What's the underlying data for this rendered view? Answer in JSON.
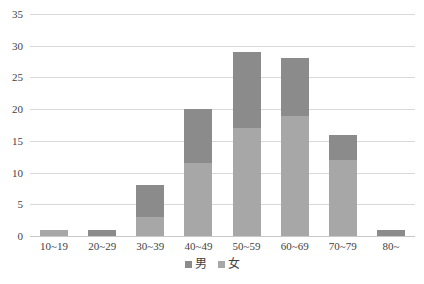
{
  "chart_data": {
    "type": "bar",
    "subtype": "stacked-column",
    "title": "",
    "subtitle": "",
    "xlabel": "",
    "ylabel": "",
    "categories": [
      "10~19",
      "20~29",
      "30~39",
      "40~49",
      "50~59",
      "60~69",
      "70~79",
      "80~"
    ],
    "series": [
      {
        "name": "女",
        "legend": "女",
        "color": "#a7a7a7",
        "stack_order": "bottom",
        "values": [
          1,
          0,
          3,
          11.5,
          17,
          19,
          12,
          0
        ]
      },
      {
        "name": "男",
        "legend": "男",
        "color": "#8b8b8b",
        "stack_order": "top",
        "values": [
          0,
          1,
          5,
          8.5,
          12,
          9,
          4,
          1
        ]
      }
    ],
    "totals": [
      1,
      1,
      8,
      20,
      29,
      28,
      16,
      1
    ],
    "ylim": [
      0,
      35
    ],
    "y_ticks": [
      0,
      5,
      10,
      15,
      20,
      25,
      30,
      35
    ],
    "y_tick_labels": [
      "0",
      "5",
      "10",
      "15",
      "20",
      "25",
      "30",
      "35"
    ],
    "grid": true,
    "grid_axis": "y",
    "legend_position": "bottom",
    "legend_entries": [
      {
        "label": "男",
        "color": "#8b8b8b",
        "swatch": "male"
      },
      {
        "label": "女",
        "color": "#a7a7a7",
        "swatch": "female"
      }
    ],
    "colors": {
      "male": "#8b8b8b",
      "female": "#a7a7a7",
      "gridline": "#d9d9d9",
      "axis": "#c8c8c8",
      "text": "#3f3f3f",
      "background": "#ffffff"
    }
  }
}
